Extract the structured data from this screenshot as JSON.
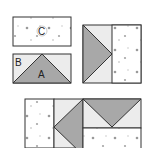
{
  "diagram": {
    "pieces": {
      "c_label": "C",
      "b_label": "B",
      "a_label": "A"
    },
    "colors": {
      "print_fabric": "#ffffff",
      "light_fabric": "#ececec",
      "dark_fabric": "#a8a8a8",
      "outline": "#333333",
      "speck": "#9a9a9a"
    }
  }
}
